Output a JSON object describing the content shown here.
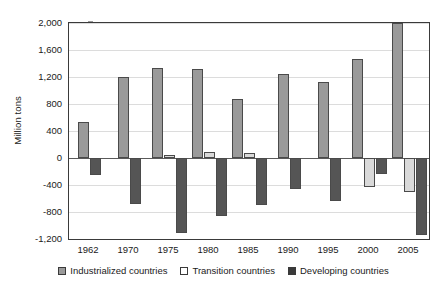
{
  "chart_data": {
    "type": "bar",
    "title": "",
    "xlabel": "",
    "ylabel": "Million tons",
    "categories": [
      "1962",
      "1970",
      "1975",
      "1980",
      "1985",
      "1990",
      "1995",
      "2000",
      "2005"
    ],
    "ylim": [
      -1200,
      2000
    ],
    "yticks": [
      2000,
      1600,
      1200,
      800,
      400,
      0,
      -400,
      -800,
      -1200
    ],
    "ytick_labels": [
      "2,000",
      "1,600",
      "1,200",
      "800",
      "400",
      "0",
      "-400",
      "-800",
      "-1,200"
    ],
    "grid": true,
    "legend_position": "bottom",
    "series": [
      {
        "name": "Industrialized countries",
        "color": "#9a9a9a",
        "values": [
          530,
          1205,
          1340,
          1325,
          880,
          1240,
          1120,
          1470,
          2005
        ]
      },
      {
        "name": "Transition countries",
        "color": "#d9d9d9",
        "values": [
          0,
          0,
          40,
          85,
          80,
          0,
          0,
          -430,
          -500
        ]
      },
      {
        "name": "Developing countries",
        "color": "#555555",
        "values": [
          -250,
          -680,
          -1105,
          -860,
          -690,
          -460,
          -630,
          -230,
          -1140
        ]
      }
    ]
  }
}
